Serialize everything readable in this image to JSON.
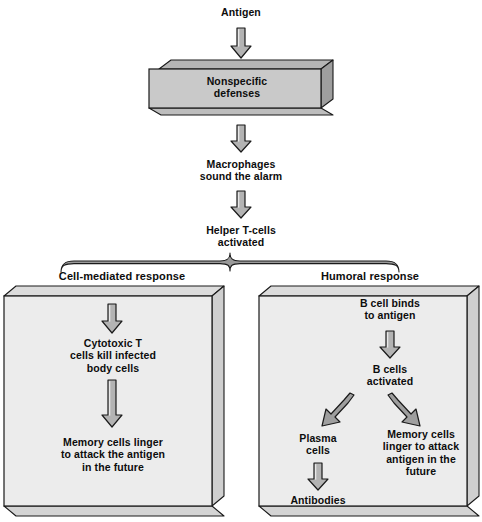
{
  "diagram": {
    "title_node": "Antigen",
    "nonspecific_box": "Nonspecific\ndefenses",
    "macrophages": "Macrophages\nsound the alarm",
    "helper_t": "Helper T-cells\nactivated",
    "branch_labels": {
      "left": "Cell-mediated response",
      "right": "Humoral response"
    },
    "left_branch": {
      "step1": "Cytotoxic T\ncells kill infected\nbody cells",
      "step2": "Memory cells linger\nto attack the antigen\nin the future"
    },
    "right_branch": {
      "step1": "B cell binds\nto antigen",
      "step2": "B cells\nactivated",
      "plasma": "Plasma\ncells",
      "antibodies": "Antibodies",
      "memory": "Memory cells\nlinger to attack\nantigen in the\nfuture"
    }
  },
  "colors": {
    "box_fill": "#c9c9c9",
    "panel_fill": "#ececec",
    "arrow_fill": "#b3b3b3",
    "stroke": "#1a1a1a",
    "background": "#ffffff"
  }
}
